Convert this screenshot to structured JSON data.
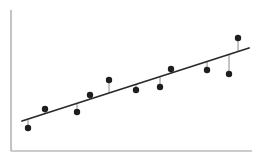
{
  "chart_data": {
    "type": "scatter",
    "title": "",
    "xlabel": "",
    "ylabel": "",
    "grid": false,
    "legend": null,
    "axes": {
      "show_ticks": false,
      "show_tick_labels": false
    },
    "points": [
      {
        "x": 28,
        "y": 128
      },
      {
        "x": 45,
        "y": 109
      },
      {
        "x": 77,
        "y": 112
      },
      {
        "x": 90,
        "y": 95
      },
      {
        "x": 109,
        "y": 80
      },
      {
        "x": 136,
        "y": 90
      },
      {
        "x": 160,
        "y": 87
      },
      {
        "x": 171,
        "y": 69
      },
      {
        "x": 207,
        "y": 70
      },
      {
        "x": 229,
        "y": 74
      },
      {
        "x": 238,
        "y": 38
      }
    ],
    "regression_line": {
      "x1": 22,
      "y1": 121,
      "x2": 249,
      "y2": 48
    },
    "coordinate_note": "values are in screen pixel space (y grows downward)",
    "plot_area": {
      "axis_x": 11,
      "axis_top": 10,
      "axis_bottom": 151,
      "axis_right": 252
    },
    "colors": {
      "axis": "#9a9a9a",
      "line": "#2a2a2a",
      "points": "#1e1e1e",
      "residuals": "#8a8a8a",
      "background": "#ffffff"
    }
  }
}
